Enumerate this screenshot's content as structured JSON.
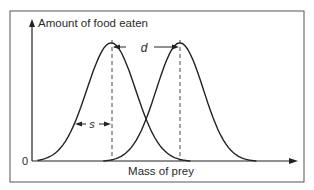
{
  "figure": {
    "y_axis_label": "Amount of food eaten",
    "x_axis_label": "Mass of prey",
    "origin_label": "0",
    "distance_label": "d",
    "spread_label": "s"
  },
  "chart_data": {
    "type": "line",
    "title": "",
    "xlabel": "Mass of prey",
    "ylabel": "Amount of food eaten",
    "origin_tick": "0",
    "series": [
      {
        "name": "species 1",
        "shape": "bell",
        "peak_x": 0.3,
        "peak_y": 0.85,
        "x_start": 0.02,
        "x_end": 0.6
      },
      {
        "name": "species 2",
        "shape": "bell",
        "peak_x": 0.56,
        "peak_y": 0.85,
        "x_start": 0.27,
        "x_end": 0.85
      }
    ],
    "annotations": [
      {
        "label": "d",
        "meaning": "distance between peaks",
        "from_x": 0.3,
        "to_x": 0.56
      },
      {
        "label": "s",
        "meaning": "spread (width) of curve",
        "from_x": 0.17,
        "to_x": 0.3
      }
    ],
    "grid": false,
    "legend": "none"
  }
}
